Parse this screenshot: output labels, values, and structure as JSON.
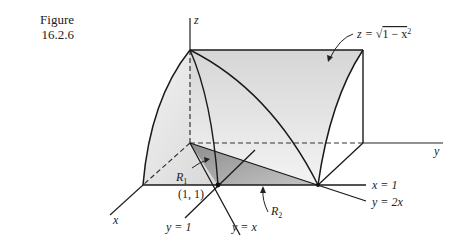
{
  "caption": {
    "label": "Figure",
    "number": "16.2.6"
  },
  "axes": {
    "x": "x",
    "y": "y",
    "z": "z"
  },
  "surface_label": "z = √(1 − x²)",
  "surface_label_parts": {
    "lhs": "z = ",
    "radical": "√",
    "radicand": "1 − x",
    "exp": "2"
  },
  "regions": {
    "r1": {
      "name": "R",
      "sub": "1"
    },
    "r2": {
      "name": "R",
      "sub": "2"
    }
  },
  "point_label": "(1, 1)",
  "line_labels": {
    "x_eq_1": "x = 1",
    "y_eq_2x": "y = 2x",
    "y_eq_1": "y = 1",
    "y_eq_x": "y = x"
  },
  "colors": {
    "line": "#1a1a1a",
    "surface_light": "#e6e6e6",
    "surface_mid": "#d2d2d2",
    "region_dark": "#a8a8a8"
  }
}
